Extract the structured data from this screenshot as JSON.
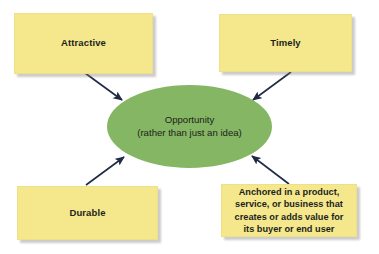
{
  "diagram": {
    "title_text": "",
    "colors": {
      "note_fill": "#f4e78c",
      "ellipse_fill": "#85b664",
      "text": "#231f20",
      "arrow": "#1f2a44",
      "background": "#ffffff"
    },
    "center_node": {
      "shape": "ellipse",
      "line1": "Opportunity",
      "line2": "(rather than just an idea)"
    },
    "notes": [
      {
        "id": "attractive",
        "label": "Attractive",
        "position": "top-left"
      },
      {
        "id": "timely",
        "label": "Timely",
        "position": "top-right"
      },
      {
        "id": "durable",
        "label": "Durable",
        "position": "bottom-left"
      },
      {
        "id": "anchored",
        "position": "bottom-right",
        "lines": [
          "Anchored in a product,",
          "service, or business that",
          "creates or adds value for",
          "its buyer or end user"
        ]
      }
    ],
    "arrows": [
      {
        "id": "attractive-to-center",
        "from": "attractive",
        "to": "center",
        "direction": "down-right"
      },
      {
        "id": "timely-to-center",
        "from": "timely",
        "to": "center",
        "direction": "down-left"
      },
      {
        "id": "durable-to-center",
        "from": "durable",
        "to": "center",
        "direction": "up-right"
      },
      {
        "id": "anchored-to-center",
        "from": "anchored",
        "to": "center",
        "direction": "up-left"
      }
    ]
  }
}
